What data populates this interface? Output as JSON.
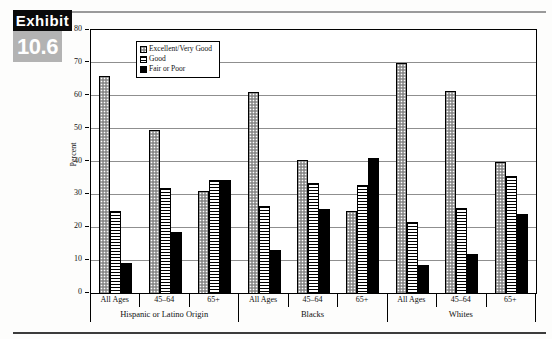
{
  "exhibit": {
    "label": "Exhibit",
    "number": "10.6"
  },
  "chart_data": {
    "type": "bar",
    "title": "",
    "xlabel": "",
    "ylabel": "Percent",
    "ylim": [
      0,
      80
    ],
    "ytick_interval": 10,
    "yticks": [
      0,
      10,
      20,
      30,
      40,
      50,
      60,
      70,
      80
    ],
    "grid": "horizontal",
    "legend_position": "top-left-inside",
    "categories": [
      "All Ages",
      "45–64",
      "65+",
      "All Ages",
      "45–64",
      "65+",
      "All Ages",
      "45–64",
      "65+"
    ],
    "groups": [
      {
        "label": "Hispanic or Latino Origin",
        "span": 3
      },
      {
        "label": "Blacks",
        "span": 3
      },
      {
        "label": "Whites",
        "span": 3
      }
    ],
    "series": [
      {
        "name": "Excellent/Very Good",
        "pattern": "dots",
        "values": [
          66,
          49.5,
          31,
          61,
          40.5,
          25,
          70,
          61.5,
          40
        ]
      },
      {
        "name": "Good",
        "pattern": "horizontal-stripes",
        "values": [
          25,
          32,
          34.5,
          26.5,
          33.5,
          33,
          21.5,
          26,
          35.5
        ]
      },
      {
        "name": "Fair or Poor",
        "pattern": "solid-black",
        "values": [
          9,
          18.5,
          34.5,
          13,
          25.5,
          41,
          8.5,
          12,
          24
        ]
      }
    ]
  },
  "colors": {
    "background": "#ffffff",
    "bar_outline": "#000000",
    "gridline": "#8f8f8f",
    "header_black_box": "#0a0a0a",
    "header_gray_box": "#b3b3b3",
    "top_rule": "#9a9a9a",
    "bottom_rule": "#3c3c3c"
  }
}
